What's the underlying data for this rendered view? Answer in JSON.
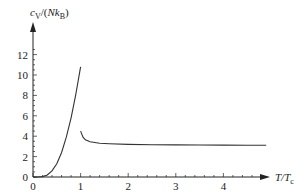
{
  "chart_data": {
    "type": "line",
    "title": "",
    "xlabel": "T/T_c",
    "ylabel": "c_V/(Nk_B)",
    "xlabel_parts": {
      "main": "T/T",
      "sub": "c"
    },
    "ylabel_parts": {
      "c": "c",
      "csub": "V",
      "mid": "/(",
      "N": "Nk",
      "nsub": "B",
      "end": ")"
    },
    "xlim": [
      0,
      5
    ],
    "ylim": [
      0,
      13
    ],
    "x_ticks": [
      0,
      1,
      2,
      3,
      4
    ],
    "y_ticks": [
      0,
      2,
      4,
      6,
      8,
      10,
      12
    ],
    "grid": false,
    "legend": null,
    "series": [
      {
        "name": "below T_c",
        "x": [
          0,
          0.1,
          0.2,
          0.3,
          0.4,
          0.5,
          0.6,
          0.7,
          0.8,
          0.9,
          1.0
        ],
        "y": [
          0,
          0.004,
          0.04,
          0.2,
          0.6,
          1.3,
          2.4,
          3.9,
          5.8,
          8.1,
          10.8
        ]
      },
      {
        "name": "above T_c",
        "x": [
          1.0,
          1.05,
          1.1,
          1.2,
          1.4,
          1.6,
          2.0,
          2.5,
          3.0,
          3.5,
          4.0,
          4.5,
          4.9
        ],
        "y": [
          4.5,
          3.9,
          3.65,
          3.45,
          3.3,
          3.25,
          3.2,
          3.17,
          3.15,
          3.14,
          3.13,
          3.12,
          3.12
        ]
      }
    ]
  },
  "axis": {
    "x_tick_labels": [
      "0",
      "1",
      "2",
      "3",
      "4"
    ],
    "y_tick_labels": [
      "0",
      "2",
      "4",
      "6",
      "8",
      "10",
      "12"
    ]
  },
  "style": {
    "line_color": "#333333",
    "axis_color": "#222222"
  }
}
